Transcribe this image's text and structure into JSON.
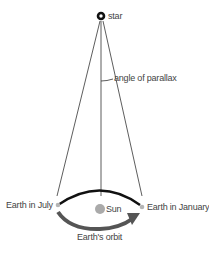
{
  "title": "",
  "labels": {
    "star": "star",
    "angle": "angle of parallax",
    "earth_july": "Earth in July",
    "sun": "Sun",
    "earth_january": "Earth in January",
    "orbit": "Earth's orbit"
  },
  "colors": {
    "line": "#333333",
    "planet": "#b5b5b5",
    "sun": "#aaaaaa",
    "arrow": "#555555",
    "arc": "#111111"
  },
  "icons": {
    "star": "ring-star-icon",
    "sun": "sun-circle-icon",
    "earth": "earth-dot-icon"
  }
}
